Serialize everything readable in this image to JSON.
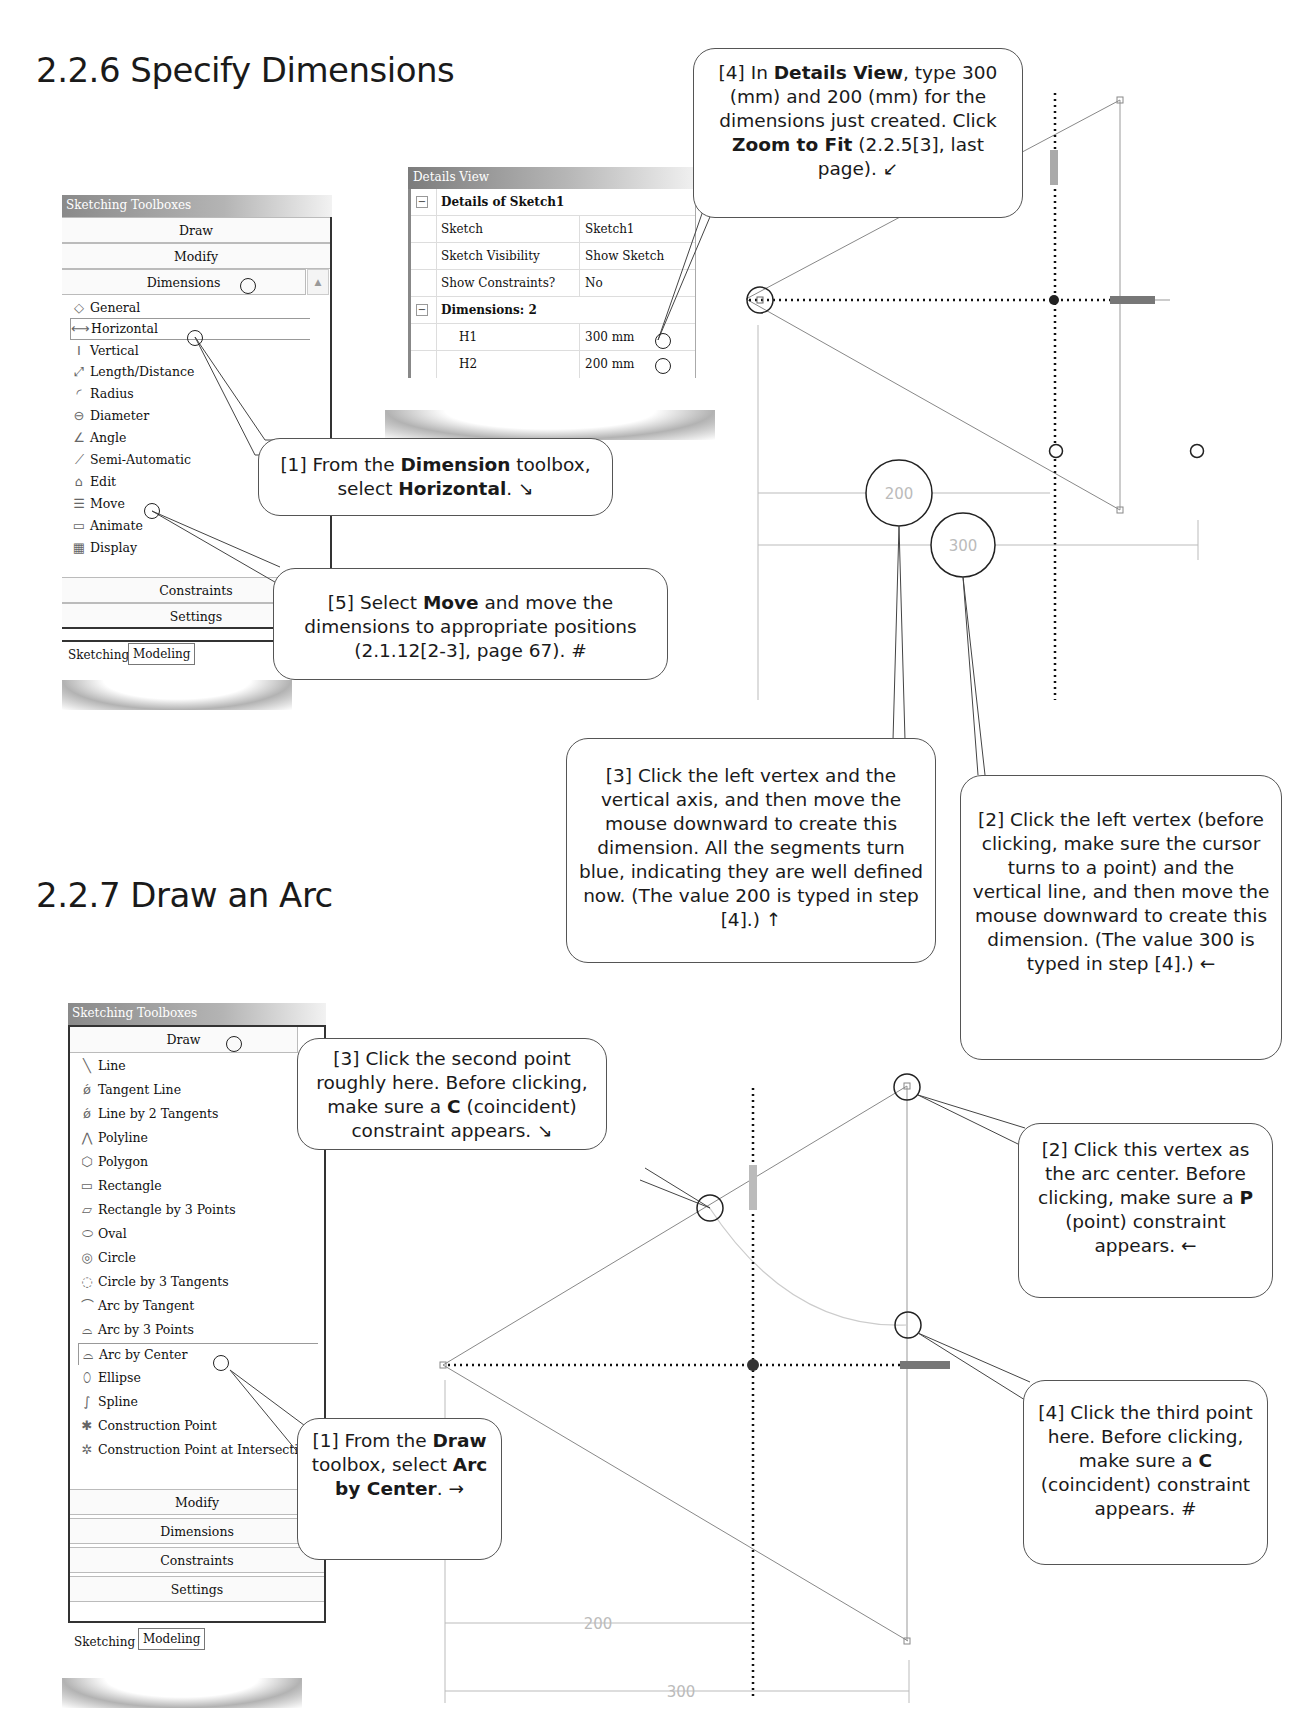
{
  "sections": [
    {
      "number": "2.2.6",
      "title": "Specify Dimensions",
      "full": "2.2.6  Specify Dimensions"
    },
    {
      "number": "2.2.7",
      "title": "Draw an Arc",
      "full": "2.2.7  Draw an Arc"
    }
  ],
  "toolbox1": {
    "title": "Sketching Toolboxes",
    "headers_top": [
      "Draw",
      "Modify",
      "Dimensions"
    ],
    "active_header": "Dimensions",
    "items": [
      {
        "label": "General",
        "icon": "general-dimension-icon",
        "glyph": "◇"
      },
      {
        "label": "Horizontal",
        "icon": "horizontal-dimension-icon",
        "glyph": "⟷",
        "selected": true
      },
      {
        "label": "Vertical",
        "icon": "vertical-dimension-icon",
        "glyph": "Ⅰ"
      },
      {
        "label": "Length/Distance",
        "icon": "length-distance-icon",
        "glyph": "⤢"
      },
      {
        "label": "Radius",
        "icon": "radius-icon",
        "glyph": "◜"
      },
      {
        "label": "Diameter",
        "icon": "diameter-icon",
        "glyph": "⊖"
      },
      {
        "label": "Angle",
        "icon": "angle-icon",
        "glyph": "∠"
      },
      {
        "label": "Semi-Automatic",
        "icon": "semi-automatic-icon",
        "glyph": "⟋"
      },
      {
        "label": "Edit",
        "icon": "edit-icon",
        "glyph": "⌂"
      },
      {
        "label": "Move",
        "icon": "move-icon",
        "glyph": "☰"
      },
      {
        "label": "Animate",
        "icon": "animate-icon",
        "glyph": "▭"
      },
      {
        "label": "Display",
        "icon": "display-icon",
        "glyph": "▦"
      }
    ],
    "headers_bottom": [
      "Constraints",
      "Settings"
    ],
    "tabs": [
      "Sketching",
      "Modeling"
    ],
    "active_tab": "Sketching"
  },
  "details_view": {
    "title": "Details View",
    "group1": "Details of Sketch1",
    "rows": [
      {
        "name": "Sketch",
        "value": "Sketch1"
      },
      {
        "name": "Sketch Visibility",
        "value": "Show Sketch"
      },
      {
        "name": "Show Constraints?",
        "value": "No"
      }
    ],
    "group2": "Dimensions: 2",
    "dimensions": [
      {
        "name": "H1",
        "value": "300 mm"
      },
      {
        "name": "H2",
        "value": "200 mm"
      }
    ]
  },
  "callouts_226": {
    "step1": {
      "pre": "[1] From the ",
      "b1": "Dimension",
      "mid": " toolbox, select ",
      "b2": "Horizontal",
      "post": ".  ↘"
    },
    "step2": {
      "text": "[2] Click the left vertex (before clicking, make sure the cursor turns to a point) and the vertical line, and then move the mouse downward to create this dimension. (The value 300 is typed in step [4].)  ←"
    },
    "step3": {
      "text": "[3] Click the left vertex and the vertical axis, and then move the mouse downward to create this dimension.  All the segments turn blue, indicating they are well defined now.  (The value 200 is typed in step [4].)  ↑"
    },
    "step4": {
      "pre": "[4] In ",
      "b1": "Details View",
      "mid1": ", type 300 (mm) and 200 (mm) for the dimensions just created. Click ",
      "b2": "Zoom to Fit",
      "post": " (2.2.5[3], last page).  ↙"
    },
    "step5": {
      "pre": "[5] Select ",
      "b1": "Move",
      "post": " and move the dimensions to appropriate positions (2.1.12[2-3], page 67).  #"
    }
  },
  "sketch1": {
    "dim_labels": [
      "200",
      "300"
    ]
  },
  "toolbox2": {
    "title": "Sketching Toolboxes",
    "active_header": "Draw",
    "items": [
      {
        "label": "Line",
        "icon": "line-icon",
        "glyph": "╲"
      },
      {
        "label": "Tangent Line",
        "icon": "tangent-line-icon",
        "glyph": "ǿ"
      },
      {
        "label": "Line by 2 Tangents",
        "icon": "line-by-2-tangents-icon",
        "glyph": "ǿ"
      },
      {
        "label": "Polyline",
        "icon": "polyline-icon",
        "glyph": "⋀"
      },
      {
        "label": "Polygon",
        "icon": "polygon-icon",
        "glyph": "⬡"
      },
      {
        "label": "Rectangle",
        "icon": "rectangle-icon",
        "glyph": "▭"
      },
      {
        "label": "Rectangle by 3 Points",
        "icon": "rectangle-by-3-points-icon",
        "glyph": "▱"
      },
      {
        "label": "Oval",
        "icon": "oval-icon",
        "glyph": "⬭"
      },
      {
        "label": "Circle",
        "icon": "circle-icon",
        "glyph": "◎"
      },
      {
        "label": "Circle by 3 Tangents",
        "icon": "circle-by-3-tangents-icon",
        "glyph": "◌"
      },
      {
        "label": "Arc by Tangent",
        "icon": "arc-by-tangent-icon",
        "glyph": "⌒"
      },
      {
        "label": "Arc by 3 Points",
        "icon": "arc-by-3-points-icon",
        "glyph": "⌓"
      },
      {
        "label": "Arc by Center",
        "icon": "arc-by-center-icon",
        "glyph": "⌓",
        "selected": true
      },
      {
        "label": "Ellipse",
        "icon": "ellipse-icon",
        "glyph": "⬯"
      },
      {
        "label": "Spline",
        "icon": "spline-icon",
        "glyph": "∫"
      },
      {
        "label": "Construction Point",
        "icon": "construction-point-icon",
        "glyph": "✱"
      },
      {
        "label": "Construction Point at Intersectio",
        "icon": "construction-point-intersection-icon",
        "glyph": "✲"
      }
    ],
    "headers_bottom": [
      "Modify",
      "Dimensions",
      "Constraints",
      "Settings"
    ],
    "tabs": [
      "Sketching",
      "Modeling"
    ],
    "active_tab": "Sketching"
  },
  "callouts_227": {
    "step1": {
      "pre": "[1] From the ",
      "b1": "Draw",
      "mid1": " toolbox, select ",
      "b2": "Arc by Center",
      "post": ".  →"
    },
    "step2": {
      "pre": "[2] Click this vertex as the arc center. Before clicking, make sure a ",
      "b1": "P",
      "post": " (point) constraint appears.  ←"
    },
    "step3": {
      "pre": "[3] Click the second point roughly here.  Before clicking, make sure a ",
      "b1": "C",
      "post": " (coincident) constraint appears.  ↘"
    },
    "step4": {
      "pre": "[4] Click the third point here.  Before clicking, make sure a ",
      "b1": "C",
      "post": " (coincident) constraint appears.  #"
    }
  },
  "sketch2": {
    "dim_labels": [
      "200",
      "300"
    ]
  }
}
